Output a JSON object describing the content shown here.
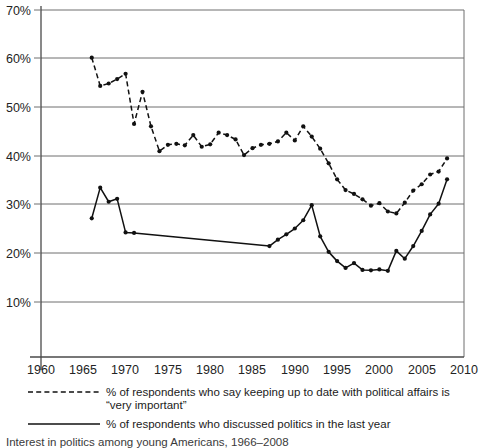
{
  "chart_data": {
    "type": "line",
    "title": "",
    "xlabel": "",
    "ylabel": "",
    "xlim": [
      1960,
      2010
    ],
    "ylim": [
      0,
      70
    ],
    "grid": true,
    "grid_axis": "y",
    "legend_position": "below-axis",
    "x_ticks": [
      1960,
      1965,
      1970,
      1975,
      1980,
      1985,
      1990,
      1995,
      2000,
      2005,
      2010
    ],
    "x_tick_labels": [
      "1960",
      "1965",
      "1970",
      "1975",
      "1980",
      "1985",
      "1990",
      "1995",
      "2000",
      "2005",
      "2010"
    ],
    "y_ticks": [
      10,
      20,
      30,
      40,
      50,
      60,
      70
    ],
    "y_tick_labels": [
      "10%",
      "20%",
      "30%",
      "40%",
      "50%",
      "60%",
      "70%"
    ],
    "series": [
      {
        "name": "% of respondents who say keeping up to date with political affairs is \"very important\"",
        "style": "dashed",
        "marker": "circle",
        "x": [
          1966,
          1967,
          1968,
          1969,
          1970,
          1971,
          1972,
          1973,
          1974,
          1975,
          1976,
          1977,
          1978,
          1979,
          1980,
          1981,
          1982,
          1983,
          1984,
          1985,
          1986,
          1987,
          1988,
          1989,
          1990,
          1991,
          1992,
          1993,
          1994,
          1995,
          1996,
          1997,
          1998,
          1999,
          2000,
          2001,
          2002,
          2003,
          2004,
          2005,
          2006,
          2007,
          2008
        ],
        "y": [
          60.2,
          54.4,
          54.9,
          55.8,
          56.9,
          46.6,
          53.2,
          46.1,
          41.0,
          42.3,
          42.5,
          42.2,
          44.3,
          41.9,
          42.4,
          44.8,
          44.3,
          43.4,
          40.2,
          41.6,
          42.3,
          42.5,
          43.0,
          44.8,
          43.2,
          46.1,
          44.0,
          41.5,
          38.5,
          35.2,
          33.0,
          32.2,
          31.1,
          29.8,
          30.3,
          28.6,
          28.2,
          30.4,
          32.9,
          34.2,
          36.2,
          36.8,
          39.5
        ]
      },
      {
        "name": "% of respondents who discussed politics in the last year",
        "style": "solid",
        "marker": "circle",
        "x": [
          1966,
          1967,
          1968,
          1969,
          1970,
          1971,
          1987,
          1988,
          1989,
          1990,
          1991,
          1992,
          1993,
          1994,
          1995,
          1996,
          1997,
          1998,
          1999,
          2000,
          2001,
          2002,
          2003,
          2004,
          2005,
          2006,
          2007,
          2008
        ],
        "y": [
          27.2,
          33.5,
          30.6,
          31.2,
          24.3,
          24.2,
          21.5,
          22.8,
          23.9,
          25.1,
          26.8,
          29.9,
          23.5,
          20.3,
          18.4,
          17.0,
          18.0,
          16.6,
          16.5,
          16.7,
          16.4,
          20.5,
          18.9,
          21.5,
          24.6,
          28.0,
          30.2,
          35.2
        ]
      }
    ]
  },
  "axes": {
    "y_axis_name": "percentage-axis",
    "x_axis_name": "year-axis"
  },
  "legend": {
    "items": [
      {
        "style": "dashed",
        "line1": "% of respondents who say keeping up to date with political affairs is",
        "line2": "“very important”"
      },
      {
        "style": "solid",
        "line1": "% of respondents who discussed politics in the last year",
        "line2": ""
      }
    ]
  },
  "caption": {
    "text": "Interest in politics among young Americans, 1966–2008"
  }
}
